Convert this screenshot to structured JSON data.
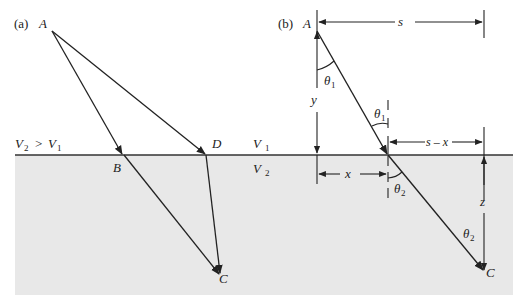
{
  "figure": {
    "colors": {
      "upper_medium": "#ffffff",
      "lower_medium": "#e8e8e8",
      "lines": "#222222"
    },
    "panel_a": {
      "label": "(a)",
      "points": {
        "A": "A",
        "B": "B",
        "C": "C",
        "D": "D"
      },
      "condition": "V₂ > V₁",
      "condition_parts": {
        "v2": "V",
        "v2_sub": "2",
        "gt": ">",
        "v1": "V",
        "v1_sub": "1"
      }
    },
    "panel_b": {
      "label": "(b)",
      "points": {
        "A": "A",
        "C": "C"
      },
      "dimensions": {
        "s": "s",
        "y": "y",
        "x": "x",
        "s_minus_x": "s – x",
        "z": "z"
      },
      "angles": {
        "theta": "θ",
        "sub1": "1",
        "sub2": "2"
      }
    },
    "media": {
      "v1": {
        "letter": "V",
        "sub": "1"
      },
      "v2": {
        "letter": "V",
        "sub": "2"
      }
    }
  }
}
